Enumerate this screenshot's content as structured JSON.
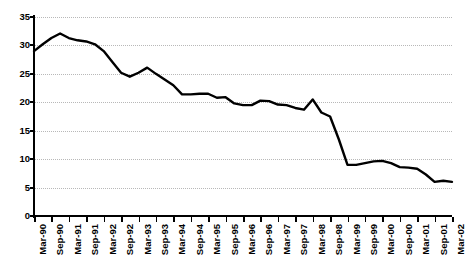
{
  "chart_data": {
    "type": "line",
    "title": "",
    "subtitle": "",
    "xlabel": "",
    "ylabel": "",
    "ylim": [
      0,
      35
    ],
    "ytick_step": 5,
    "yticks": [
      "0",
      "5",
      "10",
      "15",
      "20",
      "25",
      "30",
      "35"
    ],
    "grid": true,
    "grid_axis": "y",
    "grid_style": "dotted",
    "legend": false,
    "legend_position": "none",
    "line_color": "#000000",
    "line_width": 2.4,
    "markers": false,
    "x_tick_labels": [
      "Mar-90",
      "Sep-90",
      "Mar-91",
      "Sep-91",
      "Mar-92",
      "Sep-92",
      "Mar-93",
      "Sep-93",
      "Mar-94",
      "Sep-94",
      "Mar-95",
      "Sep-95",
      "Mar-96",
      "Sep-96",
      "Mar-97",
      "Sep-97",
      "Mar-98",
      "Sep-98",
      "Mar-99",
      "Sep-99",
      "Mar-00",
      "Sep-00",
      "Mar-01",
      "Sep-01",
      "Mar-02"
    ],
    "x_label_interval": 2,
    "x": [
      "Mar-90",
      "Jun-90",
      "Sep-90",
      "Dec-90",
      "Mar-91",
      "Jun-91",
      "Sep-91",
      "Dec-91",
      "Mar-92",
      "Jun-92",
      "Sep-92",
      "Dec-92",
      "Mar-93",
      "Jun-93",
      "Sep-93",
      "Dec-93",
      "Mar-94",
      "Jun-94",
      "Sep-94",
      "Dec-94",
      "Mar-95",
      "Jun-95",
      "Sep-95",
      "Dec-95",
      "Mar-96",
      "Jun-96",
      "Sep-96",
      "Dec-96",
      "Mar-97",
      "Jun-97",
      "Sep-97",
      "Dec-97",
      "Mar-98",
      "Jun-98",
      "Sep-98",
      "Dec-98",
      "Mar-99",
      "Jun-99",
      "Sep-99",
      "Dec-99",
      "Mar-00",
      "Jun-00",
      "Sep-00",
      "Dec-00",
      "Mar-01",
      "Jun-01",
      "Sep-01",
      "Dec-01",
      "Mar-02"
    ],
    "values": [
      29.0,
      30.2,
      31.3,
      32.1,
      31.3,
      30.9,
      30.7,
      30.2,
      29.0,
      27.1,
      25.2,
      24.5,
      25.2,
      26.1,
      25.0,
      24.0,
      23.0,
      21.4,
      21.4,
      21.5,
      21.5,
      20.8,
      20.9,
      19.8,
      19.5,
      19.5,
      20.3,
      20.2,
      19.6,
      19.5,
      19.0,
      18.7,
      20.5,
      18.2,
      17.5,
      13.5,
      9.0,
      9.0,
      9.3,
      9.6,
      9.7,
      9.3,
      8.6,
      8.5,
      8.3,
      7.3,
      6.0,
      6.2,
      6.0
    ],
    "series": [
      {
        "name": "series-1",
        "values": [
          29.0,
          30.2,
          31.3,
          32.1,
          31.3,
          30.9,
          30.7,
          30.2,
          29.0,
          27.1,
          25.2,
          24.5,
          25.2,
          26.1,
          25.0,
          24.0,
          23.0,
          21.4,
          21.4,
          21.5,
          21.5,
          20.8,
          20.9,
          19.8,
          19.5,
          19.5,
          20.3,
          20.2,
          19.6,
          19.5,
          19.0,
          18.7,
          20.5,
          18.2,
          17.5,
          13.5,
          9.0,
          9.0,
          9.3,
          9.6,
          9.7,
          9.3,
          8.6,
          8.5,
          8.3,
          7.3,
          6.0,
          6.2,
          6.0
        ]
      }
    ]
  }
}
